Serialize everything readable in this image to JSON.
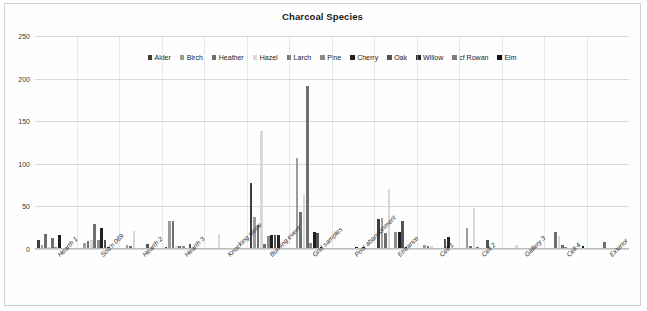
{
  "chart_data": {
    "type": "bar",
    "title": "Charcoal Species",
    "xlabel": "",
    "ylabel": "",
    "ylim": [
      0,
      250
    ],
    "yticks": [
      0,
      50,
      100,
      150,
      200,
      250
    ],
    "grid": true,
    "legend_position": "top-center",
    "categories": [
      "Hearth 1",
      "Sou'n 069",
      "Hearth 2",
      "Hearth 3",
      "Knocking stone",
      "Burning event",
      "Grid samples",
      "Post abandonment",
      "Entrance",
      "Cell 1",
      "Cell 2",
      "Gallery 3",
      "Cell 4",
      "Exterior"
    ],
    "series": [
      {
        "name": "Alder",
        "color": "#3f3f3f",
        "values": [
          11,
          0,
          0,
          2,
          0,
          77,
          0,
          0,
          35,
          0,
          0,
          0,
          0,
          0
        ]
      },
      {
        "name": "Birch",
        "color": "#9c9c9c",
        "values": [
          5,
          7,
          5,
          33,
          0,
          37,
          107,
          1,
          36,
          5,
          25,
          0,
          1,
          0
        ]
      },
      {
        "name": "Heather",
        "color": "#6e6e6e",
        "values": [
          18,
          9,
          3,
          33,
          0,
          28,
          43,
          0,
          19,
          3,
          4,
          0,
          20,
          0
        ]
      },
      {
        "name": "Hazel",
        "color": "#d8d8d8",
        "values": [
          2,
          10,
          21,
          4,
          18,
          138,
          63,
          0,
          70,
          4,
          48,
          5,
          15,
          0
        ]
      },
      {
        "name": "Larch",
        "color": "#707070",
        "values": [
          13,
          29,
          1,
          3,
          0,
          6,
          191,
          0,
          0,
          1,
          2,
          0,
          5,
          8
        ]
      },
      {
        "name": "Pine",
        "color": "#8a8a8a",
        "values": [
          2,
          10,
          0,
          3,
          0,
          15,
          7,
          1,
          20,
          0,
          1,
          0,
          2,
          0
        ]
      },
      {
        "name": "Cherry",
        "color": "#1f1f1f",
        "values": [
          17,
          25,
          0,
          1,
          0,
          17,
          20,
          2,
          20,
          0,
          0,
          0,
          0,
          0
        ]
      },
      {
        "name": "Oak",
        "color": "#545454",
        "values": [
          0,
          10,
          6,
          6,
          0,
          16,
          19,
          1,
          33,
          12,
          11,
          0,
          0,
          1
        ]
      },
      {
        "name": "Willow",
        "color": "#262626",
        "values": [
          0,
          2,
          1,
          0,
          1,
          16,
          2,
          2,
          2,
          14,
          0,
          0,
          0,
          0
        ]
      },
      {
        "name": "cf Rowan",
        "color": "#7d7d7d",
        "values": [
          0,
          0,
          0,
          0,
          0,
          1,
          1,
          1,
          1,
          0,
          0,
          0,
          0,
          0
        ]
      },
      {
        "name": "Elm",
        "color": "#121212",
        "values": [
          0,
          0,
          0,
          0,
          0,
          0,
          1,
          0,
          1,
          0,
          0,
          0,
          3,
          0
        ]
      }
    ]
  },
  "legend": {
    "items": [
      {
        "label": "Alder"
      },
      {
        "label": "Birch"
      },
      {
        "label": "Heather"
      },
      {
        "label": "Hazel"
      },
      {
        "label": "Larch"
      },
      {
        "label": "Pine"
      },
      {
        "label": "Cherry"
      },
      {
        "label": "Oak"
      },
      {
        "label": "Willow"
      },
      {
        "label": "cf Rowan"
      },
      {
        "label": "Elm"
      }
    ]
  }
}
